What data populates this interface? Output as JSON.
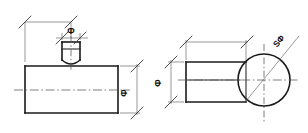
{
  "drawing": {
    "title": "Two-view engineering drawing of a stepped shaft with spherical end",
    "background_color": "#ffffff",
    "object_line_color": "#1a1a1a",
    "dimension_line_color": "#6b6b6b",
    "center_line_color": "#555555",
    "text_color": "#0d0d0d",
    "width": 308,
    "height": 133
  },
  "views": {
    "left": {
      "name": "front-view",
      "label": "Front View",
      "dimensions": [
        {
          "id": "top-overall",
          "symbol": "",
          "text": "",
          "orientation": "horizontal",
          "position": "top"
        },
        {
          "id": "boss-diameter",
          "symbol": "Φ",
          "text": "Φ",
          "orientation": "horizontal",
          "position": "top-boss"
        },
        {
          "id": "body-diameter-right",
          "symbol": "Φ",
          "text": "Φ",
          "orientation": "vertical",
          "position": "right"
        }
      ]
    },
    "right": {
      "name": "side-view",
      "label": "Side View",
      "dimensions": [
        {
          "id": "length-overall",
          "symbol": "",
          "text": "",
          "orientation": "horizontal",
          "position": "top"
        },
        {
          "id": "shank-diameter",
          "symbol": "Φ",
          "text": "Φ",
          "orientation": "vertical",
          "position": "left"
        },
        {
          "id": "spherical-diameter",
          "symbol": "SΦ",
          "text": "SΦ",
          "orientation": "diagonal",
          "position": "upper-right"
        }
      ]
    }
  },
  "symbols": {
    "diameter": "Φ",
    "spherical_diameter": "SΦ"
  }
}
